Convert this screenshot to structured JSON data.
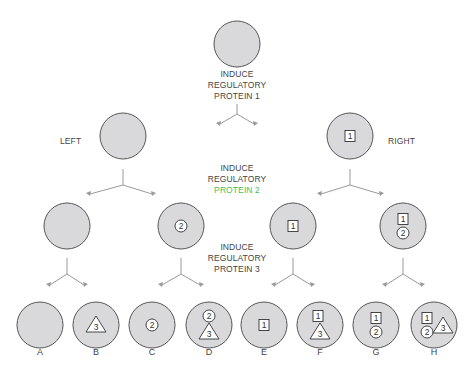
{
  "colors": {
    "cell_fill": "#d9d9db",
    "cell_stroke": "#555555",
    "arrow": "#9a9a9a",
    "text": "#444444",
    "marker_fill": "#ffffff",
    "marker_stroke": "#333333",
    "protein2_text": "#3fbf5a"
  },
  "steps": [
    {
      "line1": "INDUCE",
      "line2": "REGULATORY",
      "line3": "PROTEIN 1",
      "x": 237,
      "y": 75
    },
    {
      "line1": "INDUCE",
      "line2": "REGULATORY",
      "line3": "PROTEIN 2",
      "x": 237,
      "y": 170
    },
    {
      "line1": "INDUCE",
      "line2": "REGULATORY",
      "line3": "PROTEIN 3",
      "x": 237,
      "y": 245
    }
  ],
  "branch_labels": {
    "left": "LEFT",
    "right": "RIGHT"
  },
  "cells": [
    {
      "id": "root",
      "x": 237,
      "y": 44,
      "markers": []
    },
    {
      "id": "left",
      "x": 123,
      "y": 136,
      "markers": []
    },
    {
      "id": "right",
      "x": 350,
      "y": 136,
      "markers": [
        {
          "type": "square",
          "value": "1",
          "dx": 0,
          "dy": 0
        }
      ]
    },
    {
      "id": "left-left",
      "x": 67,
      "y": 226,
      "markers": []
    },
    {
      "id": "left-right",
      "x": 181,
      "y": 226,
      "markers": [
        {
          "type": "circle",
          "value": "2",
          "dx": 0,
          "dy": 0
        }
      ]
    },
    {
      "id": "right-left",
      "x": 293,
      "y": 226,
      "markers": [
        {
          "type": "square",
          "value": "1",
          "dx": 0,
          "dy": 0
        }
      ]
    },
    {
      "id": "right-right",
      "x": 403,
      "y": 226,
      "markers": [
        {
          "type": "square",
          "value": "1",
          "dx": 0,
          "dy": -7
        },
        {
          "type": "circle",
          "value": "2",
          "dx": 0,
          "dy": 7
        }
      ]
    },
    {
      "id": "A",
      "x": 40,
      "y": 325,
      "markers": []
    },
    {
      "id": "B",
      "x": 96,
      "y": 325,
      "markers": [
        {
          "type": "triangle",
          "value": "3",
          "dx": 0,
          "dy": 0
        }
      ]
    },
    {
      "id": "C",
      "x": 152,
      "y": 325,
      "markers": [
        {
          "type": "circle",
          "value": "2",
          "dx": 0,
          "dy": 0
        }
      ]
    },
    {
      "id": "D",
      "x": 209,
      "y": 325,
      "markers": [
        {
          "type": "circle",
          "value": "2",
          "dx": 0,
          "dy": -9
        },
        {
          "type": "triangle",
          "value": "3",
          "dx": 0,
          "dy": 7
        }
      ]
    },
    {
      "id": "E",
      "x": 264,
      "y": 325,
      "markers": [
        {
          "type": "square",
          "value": "1",
          "dx": 0,
          "dy": 0
        }
      ]
    },
    {
      "id": "F",
      "x": 320,
      "y": 325,
      "markers": [
        {
          "type": "square",
          "value": "1",
          "dx": -2,
          "dy": -9
        },
        {
          "type": "triangle",
          "value": "3",
          "dx": 0,
          "dy": 7
        }
      ]
    },
    {
      "id": "G",
      "x": 376,
      "y": 325,
      "markers": [
        {
          "type": "square",
          "value": "1",
          "dx": 0,
          "dy": -7
        },
        {
          "type": "circle",
          "value": "2",
          "dx": 0,
          "dy": 7
        }
      ]
    },
    {
      "id": "H",
      "x": 434,
      "y": 325,
      "markers": [
        {
          "type": "square",
          "value": "1",
          "dx": -7,
          "dy": -7
        },
        {
          "type": "circle",
          "value": "2",
          "dx": -7,
          "dy": 7
        },
        {
          "type": "triangle",
          "value": "3",
          "dx": 9,
          "dy": 1
        }
      ]
    }
  ],
  "forks": [
    {
      "x": 237,
      "y": 104,
      "stem": 10,
      "lx": 220,
      "rx": 254,
      "ly": 126
    },
    {
      "x": 123,
      "y": 169,
      "stem": 16,
      "lx": 90,
      "rx": 152,
      "ly": 196
    },
    {
      "x": 350,
      "y": 169,
      "stem": 16,
      "lx": 321,
      "rx": 380,
      "ly": 196
    },
    {
      "x": 67,
      "y": 258,
      "stem": 16,
      "lx": 50,
      "rx": 84,
      "ly": 287
    },
    {
      "x": 181,
      "y": 258,
      "stem": 16,
      "lx": 162,
      "rx": 200,
      "ly": 287
    },
    {
      "x": 293,
      "y": 258,
      "stem": 16,
      "lx": 275,
      "rx": 311,
      "ly": 287
    },
    {
      "x": 403,
      "y": 258,
      "stem": 16,
      "lx": 386,
      "rx": 421,
      "ly": 287
    }
  ],
  "leaves": [
    {
      "label": "A",
      "x": 40
    },
    {
      "label": "B",
      "x": 96
    },
    {
      "label": "C",
      "x": 152
    },
    {
      "label": "D",
      "x": 209
    },
    {
      "label": "E",
      "x": 264
    },
    {
      "label": "F",
      "x": 320
    },
    {
      "label": "G",
      "x": 376
    },
    {
      "label": "H",
      "x": 434
    }
  ]
}
